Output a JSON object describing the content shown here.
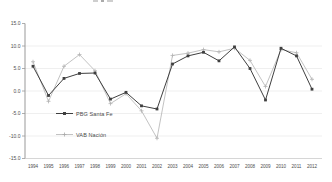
{
  "chart_data": {
    "type": "line",
    "x": [
      "1994",
      "1995",
      "1996",
      "1997",
      "1998",
      "1999",
      "2000",
      "2001",
      "2002",
      "2003",
      "2004",
      "2005",
      "2006",
      "2007",
      "2008",
      "2009",
      "2010",
      "2011",
      "2012"
    ],
    "yticks": [
      "15.0",
      "10.0",
      "5.0",
      "0.0",
      "-5.0",
      "-10.0",
      "-15.0"
    ],
    "ylim": [
      -15,
      15
    ],
    "grid_values": [
      10,
      5,
      0,
      -5,
      -10
    ],
    "grid_on": true,
    "legend_position": "inside-bottom-left",
    "series": [
      {
        "name": "PBG Santa Fe",
        "marker": "square",
        "color": "#3f3f3f",
        "values": [
          5.5,
          -1.0,
          2.8,
          3.9,
          4.0,
          -1.8,
          -0.3,
          -3.3,
          -4.0,
          6.0,
          7.8,
          8.6,
          6.7,
          9.8,
          5.0,
          -2.0,
          9.5,
          7.8,
          0.4
        ]
      },
      {
        "name": "VAB Nación",
        "marker": "plus",
        "color": "#b3b3b3",
        "values": [
          6.5,
          -2.3,
          5.5,
          8.1,
          4.5,
          -2.8,
          -0.6,
          -4.4,
          -10.5,
          7.9,
          8.4,
          9.2,
          8.7,
          9.5,
          6.8,
          1.0,
          9.2,
          8.5,
          2.6
        ]
      }
    ],
    "title": "",
    "xlabel": "",
    "ylabel": ""
  },
  "colors": {
    "axis": "#999999",
    "x_axis": "#c4c4c4",
    "grid": "#e8e8e8",
    "tick_label": "#4d4d4d",
    "background": "#ffffff"
  }
}
